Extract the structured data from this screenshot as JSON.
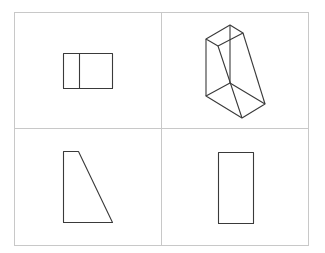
{
  "figure": {
    "colors": {
      "grid": "#c8c8c8",
      "stroke": "#3a3a3a",
      "background": "#ffffff"
    },
    "grid": {
      "left": 14,
      "top": 12,
      "right": 308,
      "bottom": 245,
      "mid_x": 161,
      "mid_y": 128
    },
    "panels": [
      {
        "id": "front-view",
        "position": "top-left",
        "shape": "rectangle split by vertical line"
      },
      {
        "id": "isometric-view",
        "position": "top-right",
        "shape": "wireframe truncated prism"
      },
      {
        "id": "side-view",
        "position": "bottom-left",
        "shape": "right trapezoid"
      },
      {
        "id": "top-view",
        "position": "bottom-right",
        "shape": "tall rectangle"
      }
    ]
  }
}
